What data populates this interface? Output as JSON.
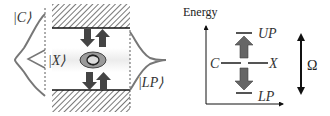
{
  "left_panel": {
    "cavity_state_label": "|C⟩",
    "exciton_state_label": "|X⟩",
    "polariton_state_label": "|LP⟩",
    "mirror_fill": "hatched",
    "gaussian_color": "#777777",
    "arrow_color": "#444444",
    "exciton_color": "#888888"
  },
  "right_panel": {
    "axis_label": "Energy",
    "upper_level_label": "UP",
    "lower_level_label": "LP",
    "cavity_level_label": "C",
    "exciton_level_label": "X",
    "splitting_label": "Ω",
    "arrow_color": "#666666"
  }
}
